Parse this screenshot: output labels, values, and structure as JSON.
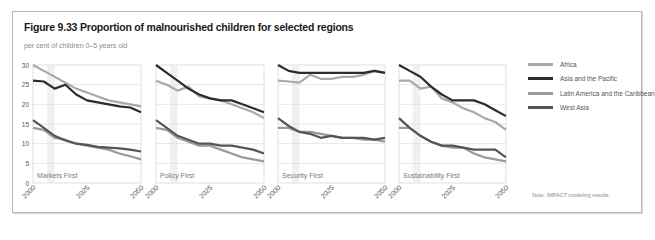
{
  "figure": {
    "title": "Figure 9.33 Proportion of malnourished children for selected regions",
    "subtitle": "per cent of children 0–5 years old",
    "note": "Note: IMPACT modeling results."
  },
  "legend": [
    {
      "name": "Africa",
      "color": "#a9a9a9"
    },
    {
      "name": "Asia and the Pacific",
      "color": "#2b2b2b"
    },
    {
      "name": "Latin America and the Caribbean",
      "color": "#9a9a9a"
    },
    {
      "name": "West Asia",
      "color": "#555555"
    }
  ],
  "chart_data": [
    {
      "type": "line",
      "title": "Markets First",
      "xlabel": "",
      "ylabel": "per cent of children 0–5 years old",
      "x": [
        2000,
        2005,
        2010,
        2015,
        2020,
        2025,
        2030,
        2035,
        2040,
        2045,
        2050
      ],
      "x_ticks": [
        "2000",
        "2025",
        "2050"
      ],
      "y_ticks": [
        0,
        5,
        10,
        15,
        20,
        25,
        30
      ],
      "ylim": [
        0,
        30
      ],
      "grid": true,
      "series": [
        {
          "name": "Africa",
          "values": [
            30,
            28.5,
            27,
            25.5,
            24,
            23,
            22,
            21,
            20.5,
            20,
            19.5
          ]
        },
        {
          "name": "Asia and the Pacific",
          "values": [
            26,
            25.8,
            24,
            25,
            22.5,
            21,
            20.5,
            20,
            19.5,
            19.2,
            18
          ]
        },
        {
          "name": "Latin America and the Caribbean",
          "values": [
            14,
            13.5,
            11.5,
            11,
            10,
            9.5,
            9,
            8.5,
            7.5,
            6.8,
            6
          ]
        },
        {
          "name": "West Asia",
          "values": [
            16,
            14,
            12,
            10.8,
            10,
            9.7,
            9.2,
            9,
            8.8,
            8.5,
            8
          ]
        }
      ]
    },
    {
      "type": "line",
      "title": "Policy First",
      "x": [
        2000,
        2005,
        2010,
        2015,
        2020,
        2025,
        2030,
        2035,
        2040,
        2045,
        2050
      ],
      "x_ticks": [
        "2000",
        "2025",
        "2050"
      ],
      "ylim": [
        0,
        30
      ],
      "grid": true,
      "series": [
        {
          "name": "Africa",
          "values": [
            26,
            25,
            23.5,
            24.5,
            22,
            21.5,
            21,
            20,
            19,
            18,
            16.5
          ]
        },
        {
          "name": "Asia and the Pacific",
          "values": [
            30,
            28,
            26,
            24,
            22.5,
            21.5,
            21,
            21,
            20,
            19,
            18
          ]
        },
        {
          "name": "Latin America and the Caribbean",
          "values": [
            14,
            13.5,
            11.5,
            10.5,
            9.5,
            9.5,
            8.5,
            7.5,
            6.5,
            6,
            5.5
          ]
        },
        {
          "name": "West Asia",
          "values": [
            16,
            14,
            12,
            11,
            10,
            10,
            9.5,
            9.5,
            9,
            8.5,
            7.5
          ]
        }
      ]
    },
    {
      "type": "line",
      "title": "Security First",
      "x": [
        2000,
        2005,
        2010,
        2015,
        2020,
        2025,
        2030,
        2035,
        2040,
        2045,
        2050
      ],
      "x_ticks": [
        "2000",
        "2025",
        "2050"
      ],
      "ylim": [
        0,
        30
      ],
      "grid": true,
      "series": [
        {
          "name": "Africa",
          "values": [
            26,
            25.8,
            25.5,
            27.5,
            26.5,
            26.5,
            27,
            27,
            27.5,
            28.5,
            28
          ]
        },
        {
          "name": "Asia and the Pacific",
          "values": [
            30,
            28.5,
            28,
            28,
            28,
            28,
            28,
            28,
            28,
            28.5,
            28
          ]
        },
        {
          "name": "Latin America and the Caribbean",
          "values": [
            14,
            14,
            13,
            13,
            12.5,
            12,
            11.5,
            11.5,
            11,
            11,
            10.5
          ]
        },
        {
          "name": "West Asia",
          "values": [
            16.5,
            14.5,
            13,
            12.5,
            11.5,
            12,
            11.5,
            11.5,
            11.5,
            11,
            11.5
          ]
        }
      ]
    },
    {
      "type": "line",
      "title": "Sustainability First",
      "x": [
        2000,
        2005,
        2010,
        2015,
        2020,
        2025,
        2030,
        2035,
        2040,
        2045,
        2050
      ],
      "x_ticks": [
        "2000",
        "2025",
        "2050"
      ],
      "ylim": [
        0,
        30
      ],
      "grid": true,
      "series": [
        {
          "name": "Africa",
          "values": [
            26,
            26,
            24,
            24.5,
            21.5,
            20.5,
            19,
            18,
            16.5,
            15.5,
            13.5
          ]
        },
        {
          "name": "Asia and the Pacific",
          "values": [
            30,
            28.5,
            27,
            24.5,
            22.5,
            21,
            21,
            21,
            20,
            18.5,
            17
          ]
        },
        {
          "name": "Latin America and the Caribbean",
          "values": [
            14,
            14,
            12,
            10.5,
            9.5,
            9,
            9,
            7.5,
            6.5,
            6,
            5.5
          ]
        },
        {
          "name": "West Asia",
          "values": [
            16.5,
            14,
            12,
            10.5,
            9.5,
            9.5,
            9,
            8.5,
            8.5,
            8.5,
            6.5
          ]
        }
      ]
    }
  ]
}
